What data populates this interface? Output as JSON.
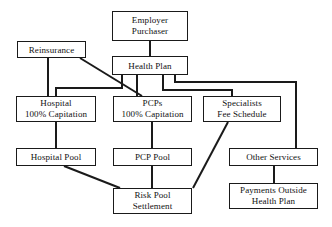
{
  "diagram": {
    "type": "flow-diagram",
    "stroke_color": "#1a1a1a",
    "background_color": "#ffffff",
    "nodes": [
      {
        "id": "employer-purchaser",
        "line1": "Employer",
        "line2": "Purchaser",
        "x": 112,
        "y": 11,
        "w": 76,
        "h": 30
      },
      {
        "id": "health-plan",
        "line1": "Health Plan",
        "line2": "",
        "x": 112,
        "y": 56,
        "w": 76,
        "h": 19
      },
      {
        "id": "reinsurance",
        "line1": "Reinsurance",
        "line2": "",
        "x": 17,
        "y": 41,
        "w": 69,
        "h": 17
      },
      {
        "id": "hospital-capitation",
        "line1": "Hospital",
        "line2": "100% Capitation",
        "x": 16,
        "y": 96,
        "w": 80,
        "h": 26
      },
      {
        "id": "pcps-capitation",
        "line1": "PCPs",
        "line2": "100% Capitation",
        "x": 113,
        "y": 96,
        "w": 79,
        "h": 26
      },
      {
        "id": "specialists-fee-schedule",
        "line1": "Specialists",
        "line2": "Fee Schedule",
        "x": 203,
        "y": 96,
        "w": 78,
        "h": 26
      },
      {
        "id": "hospital-pool",
        "line1": "Hospital Pool",
        "line2": "",
        "x": 16,
        "y": 148,
        "w": 80,
        "h": 18
      },
      {
        "id": "pcp-pool",
        "line1": "PCP Pool",
        "line2": "",
        "x": 113,
        "y": 148,
        "w": 79,
        "h": 18
      },
      {
        "id": "other-services",
        "line1": "Other Services",
        "line2": "",
        "x": 229,
        "y": 148,
        "w": 89,
        "h": 18
      },
      {
        "id": "risk-pool-settlement",
        "line1": "Risk Pool",
        "line2": "Settlement",
        "x": 113,
        "y": 188,
        "w": 79,
        "h": 26
      },
      {
        "id": "payments-outside-health-plan",
        "line1": "Payments Outside",
        "line2": "Health Plan",
        "x": 229,
        "y": 183,
        "w": 89,
        "h": 26
      }
    ],
    "edges": [
      {
        "id": "employer-to-health-plan",
        "from": "employer-purchaser",
        "to": "health-plan",
        "points": "150,41 150,56"
      },
      {
        "id": "reinsurance-to-pcps",
        "from": "reinsurance",
        "to": "pcps-capitation",
        "points": "80,58 142,96"
      },
      {
        "id": "reinsurance-to-hospital",
        "from": "reinsurance",
        "to": "hospital-capitation",
        "points": "48,58 48,96"
      },
      {
        "id": "health-plan-to-hospital",
        "from": "health-plan",
        "to": "hospital-capitation",
        "points": "122,75 122,88 56,88 56,96"
      },
      {
        "id": "health-plan-to-pcps",
        "from": "health-plan",
        "to": "pcps-capitation",
        "points": "137,75 137,96"
      },
      {
        "id": "health-plan-to-specialists",
        "from": "health-plan",
        "to": "specialists-fee-schedule",
        "points": "163,75 163,90 232,90 232,96"
      },
      {
        "id": "health-plan-to-other-services",
        "from": "health-plan",
        "to": "other-services",
        "points": "175,75 175,82 296,82 296,148"
      },
      {
        "id": "hospital-to-hospital-pool",
        "from": "hospital-capitation",
        "to": "hospital-pool",
        "points": "56,122 56,148"
      },
      {
        "id": "pcps-to-pcp-pool",
        "from": "pcps-capitation",
        "to": "pcp-pool",
        "points": "152,122 152,148"
      },
      {
        "id": "specialists-to-risk-pool",
        "from": "specialists-fee-schedule",
        "to": "risk-pool-settlement",
        "points": "228,122 193,188"
      },
      {
        "id": "hospital-pool-to-risk-pool",
        "from": "hospital-pool",
        "to": "risk-pool-settlement",
        "points": "64,166 120,188"
      },
      {
        "id": "pcp-pool-to-risk-pool",
        "from": "pcp-pool",
        "to": "risk-pool-settlement",
        "points": "152,166 152,188"
      },
      {
        "id": "other-services-to-payments",
        "from": "other-services",
        "to": "payments-outside-health-plan",
        "points": "274,166 274,183"
      }
    ]
  }
}
